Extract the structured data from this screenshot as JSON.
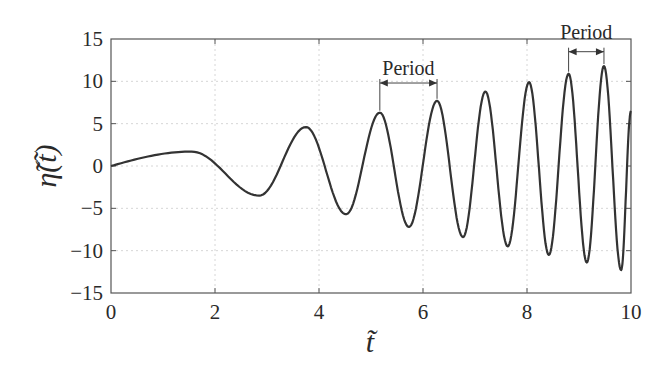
{
  "chart_data": {
    "type": "line",
    "title": "",
    "xlabel": "t̃",
    "ylabel": "η̃(t̃)",
    "xlim": [
      0,
      10
    ],
    "ylim": [
      -15,
      15
    ],
    "xticks": [
      0,
      2,
      4,
      6,
      8,
      10
    ],
    "yticks": [
      15,
      10,
      5,
      0,
      -5,
      -10,
      -15
    ],
    "xtick_labels": [
      "0",
      "2",
      "4",
      "6",
      "8",
      "10"
    ],
    "ytick_labels": [
      "15",
      "10",
      "5",
      "0",
      "−5",
      "−10",
      "−15"
    ],
    "grid": true,
    "legend": null,
    "series": [
      {
        "name": "η̃(t̃)",
        "description": "oscillation with growing amplitude and decreasing period (chirp)",
        "extrema": [
          {
            "t": 0.0,
            "y": 0.0
          },
          {
            "t": 1.55,
            "y": 1.7
          },
          {
            "t": 2.85,
            "y": -3.5
          },
          {
            "t": 3.75,
            "y": 4.6
          },
          {
            "t": 4.52,
            "y": -5.7
          },
          {
            "t": 5.17,
            "y": 6.3
          },
          {
            "t": 5.73,
            "y": -7.2
          },
          {
            "t": 6.27,
            "y": 7.7
          },
          {
            "t": 6.77,
            "y": -8.4
          },
          {
            "t": 7.2,
            "y": 8.8
          },
          {
            "t": 7.63,
            "y": -9.5
          },
          {
            "t": 8.04,
            "y": 9.9
          },
          {
            "t": 8.42,
            "y": -10.5
          },
          {
            "t": 8.8,
            "y": 10.9
          },
          {
            "t": 9.15,
            "y": -11.4
          },
          {
            "t": 9.48,
            "y": 11.8
          },
          {
            "t": 9.81,
            "y": -12.3
          },
          {
            "t": 10.0,
            "y": 6.5
          }
        ]
      }
    ],
    "annotations": [
      {
        "text": "Period",
        "t_start": 5.17,
        "t_end": 6.27,
        "label_y": 10.8,
        "arrow_y": 9.8
      },
      {
        "text": "Period",
        "t_start": 8.8,
        "t_end": 9.48,
        "label_y": 15.0,
        "arrow_y": 13.5
      }
    ]
  }
}
